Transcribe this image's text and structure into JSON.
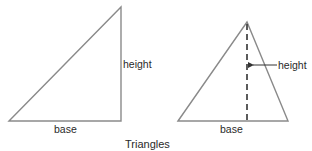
{
  "title": "Triangles",
  "colors": {
    "line": "#888888",
    "dashed": "#333333",
    "text": "#2a2a2a",
    "background": "#ffffff"
  },
  "right_triangle": {
    "base_label": "base",
    "height_label": "height"
  },
  "isosceles_triangle": {
    "base_label": "base",
    "height_label": "height"
  }
}
